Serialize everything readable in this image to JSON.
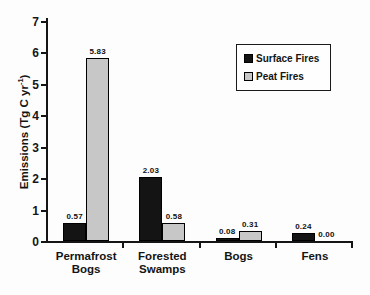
{
  "figure": {
    "background": "#fdfdfd",
    "axis_color": "#151515"
  },
  "chart_data": {
    "type": "bar",
    "title": "",
    "categories": [
      "Permafrost Bogs",
      "Forested Swamps",
      "Bogs",
      "Fens"
    ],
    "category_lines": [
      [
        "Permafrost",
        "Bogs"
      ],
      [
        "Forested",
        "Swamps"
      ],
      [
        "Bogs"
      ],
      [
        "Fens"
      ]
    ],
    "series": [
      {
        "name": "Surface Fires",
        "color": "#141414",
        "values": [
          0.57,
          2.03,
          0.08,
          0.24
        ]
      },
      {
        "name": "Peat Fires",
        "color": "#c7c7c7",
        "values": [
          5.83,
          0.58,
          0.31,
          0.0
        ]
      }
    ],
    "value_labels": {
      "shown": true,
      "decimals": 2
    },
    "xlabel": "",
    "ylabel": "Emissions (Tg C yr⁻¹)",
    "ylabel_parts": {
      "pre": "Emissions (Tg C yr",
      "sup": "-1",
      "post": ")"
    },
    "ylim": [
      0,
      7
    ],
    "yticks": [
      0,
      1,
      2,
      3,
      4,
      5,
      6,
      7
    ],
    "grid": false,
    "legend": {
      "position": "upper right",
      "entries": [
        "Surface Fires",
        "Peat Fires"
      ]
    }
  }
}
